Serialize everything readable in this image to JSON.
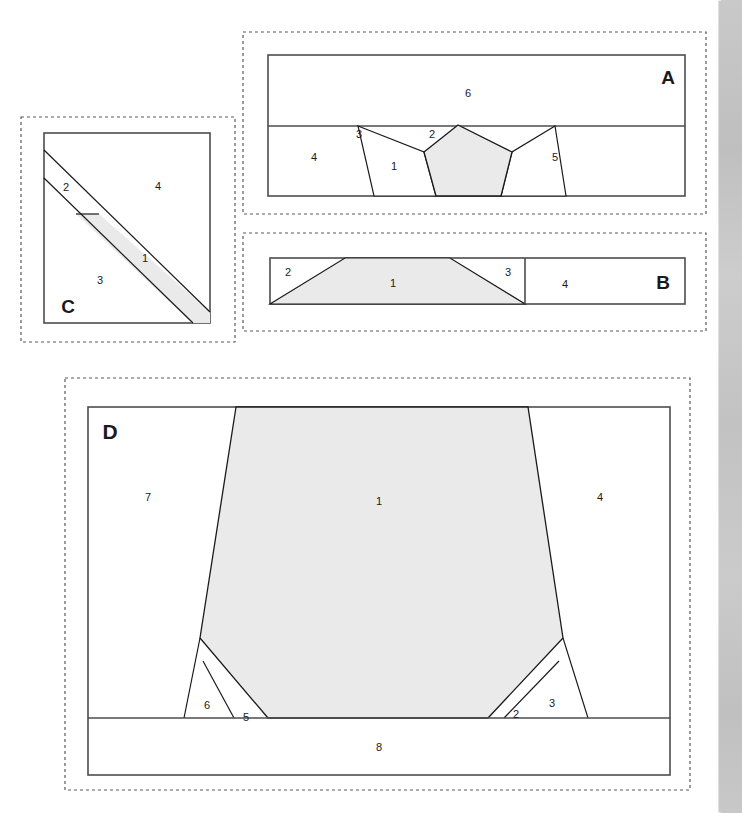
{
  "figure": {
    "colors": {
      "shaded_fill": "#eaeaea",
      "panel_fill": "#ffffff",
      "stroke": "#4d4d4d",
      "thin_stroke": "#1a1a1a",
      "dashed_stroke": "#5a5a5a",
      "label_color": "#1a1a1a",
      "texture_strip": "#c6c6c6"
    }
  },
  "panels": [
    {
      "id": "panel-a",
      "label": "A",
      "label_pos": {
        "x": 668,
        "y": 84
      },
      "dashed_rect": {
        "x": 243,
        "y": 32,
        "w": 463,
        "h": 182
      },
      "inner_rect": {
        "x": 268,
        "y": 55,
        "w": 417,
        "h": 141
      },
      "divider_y": 126,
      "regions": [
        {
          "number": "1",
          "x": 394,
          "y": 166,
          "shaded": true
        },
        {
          "number": "2",
          "x": 432,
          "y": 134,
          "shaded": false
        },
        {
          "number": "3",
          "x": 359,
          "y": 134,
          "shaded": false
        },
        {
          "number": "4",
          "x": 314,
          "y": 157,
          "shaded": false
        },
        {
          "number": "5",
          "x": 555,
          "y": 157,
          "shaded": false
        },
        {
          "number": "6",
          "x": 468,
          "y": 93,
          "shaded": false
        }
      ],
      "shapes": {
        "pentagon": "458,126 420,126 398,148 408,178 453,178 477,152",
        "pentagon_points": [
          [
            458,
            125
          ],
          [
            424,
            152
          ],
          [
            436,
            196
          ],
          [
            501,
            196
          ],
          [
            512,
            152
          ]
        ],
        "left_wedge": [
          [
            358,
            126
          ],
          [
            424,
            152
          ],
          [
            436,
            196
          ],
          [
            374,
            196
          ]
        ],
        "right_wedge": [
          [
            512,
            152
          ],
          [
            501,
            196
          ],
          [
            566,
            196
          ],
          [
            555,
            126
          ]
        ]
      }
    },
    {
      "id": "panel-b",
      "label": "B",
      "label_pos": {
        "x": 663,
        "y": 283
      },
      "dashed_rect": {
        "x": 243,
        "y": 233,
        "w": 463,
        "h": 98
      },
      "inner_rect": {
        "x": 270,
        "y": 258,
        "w": 415,
        "h": 46
      },
      "divider_x": 525,
      "regions": [
        {
          "number": "1",
          "x": 393,
          "y": 283,
          "shaded": true
        },
        {
          "number": "2",
          "x": 288,
          "y": 272,
          "shaded": false
        },
        {
          "number": "3",
          "x": 508,
          "y": 272,
          "shaded": false
        },
        {
          "number": "4",
          "x": 565,
          "y": 284,
          "shaded": false
        }
      ],
      "shapes": {
        "trapezoid": [
          [
            270,
            304
          ],
          [
            345,
            258
          ],
          [
            450,
            258
          ],
          [
            525,
            304
          ]
        ]
      }
    },
    {
      "id": "panel-c",
      "label": "C",
      "label_pos": {
        "x": 68,
        "y": 307
      },
      "dashed_rect": {
        "x": 21,
        "y": 117,
        "w": 214,
        "h": 225
      },
      "inner_rect": {
        "x": 44,
        "y": 133,
        "w": 166,
        "h": 190
      },
      "regions": [
        {
          "number": "1",
          "x": 145,
          "y": 258,
          "shaded": true
        },
        {
          "number": "2",
          "x": 66,
          "y": 187,
          "shaded": false
        },
        {
          "number": "3",
          "x": 100,
          "y": 280,
          "shaded": false
        },
        {
          "number": "4",
          "x": 158,
          "y": 186,
          "shaded": false
        }
      ],
      "shapes": {
        "band_outer": [
          [
            44,
            150
          ],
          [
            210,
            312
          ],
          [
            210,
            323
          ],
          [
            190,
            323
          ],
          [
            44,
            178
          ]
        ],
        "band_shaded": [
          [
            97,
            209
          ],
          [
            210,
            312
          ],
          [
            210,
            323
          ],
          [
            190,
            323
          ],
          [
            80,
            218
          ]
        ],
        "upper_line": [
          [
            44,
            150
          ],
          [
            210,
            312
          ]
        ],
        "lower_line": [
          [
            44,
            178
          ],
          [
            210,
            323
          ]
        ],
        "cross_tick": [
          [
            76,
            214
          ],
          [
            99,
            214
          ]
        ]
      }
    },
    {
      "id": "panel-d",
      "label": "D",
      "label_pos": {
        "x": 110,
        "y": 432
      },
      "dashed_rect": {
        "x": 65,
        "y": 378,
        "w": 625,
        "h": 412
      },
      "inner_rect": {
        "x": 88,
        "y": 407,
        "w": 582,
        "h": 368
      },
      "divider_y": 718,
      "regions": [
        {
          "number": "1",
          "x": 379,
          "y": 501,
          "shaded": true
        },
        {
          "number": "2",
          "x": 516,
          "y": 714,
          "shaded": false
        },
        {
          "number": "3",
          "x": 552,
          "y": 703,
          "shaded": false
        },
        {
          "number": "4",
          "x": 600,
          "y": 497,
          "shaded": false
        },
        {
          "number": "5",
          "x": 246,
          "y": 717,
          "shaded": false
        },
        {
          "number": "6",
          "x": 207,
          "y": 705,
          "shaded": false
        },
        {
          "number": "7",
          "x": 148,
          "y": 497,
          "shaded": false
        },
        {
          "number": "8",
          "x": 379,
          "y": 747,
          "shaded": false
        }
      ],
      "shapes": {
        "main_polygon": [
          [
            236,
            407
          ],
          [
            200,
            638
          ],
          [
            268,
            718
          ],
          [
            488,
            718
          ],
          [
            563,
            638
          ],
          [
            528,
            407
          ]
        ],
        "left_small_tri": [
          [
            200,
            638
          ],
          [
            184,
            718
          ],
          [
            234,
            718
          ]
        ],
        "left_tiny_tri": [
          [
            203,
            661
          ],
          [
            234,
            718
          ],
          [
            268,
            718
          ]
        ],
        "right_small_tri": [
          [
            563,
            638
          ],
          [
            504,
            718
          ],
          [
            557,
            718
          ]
        ],
        "right_tiny_tri": [
          [
            557,
            638
          ],
          [
            588,
            718
          ],
          [
            504,
            718
          ]
        ],
        "right_edge_line": [
          [
            563,
            638
          ],
          [
            588,
            718
          ]
        ]
      }
    }
  ]
}
